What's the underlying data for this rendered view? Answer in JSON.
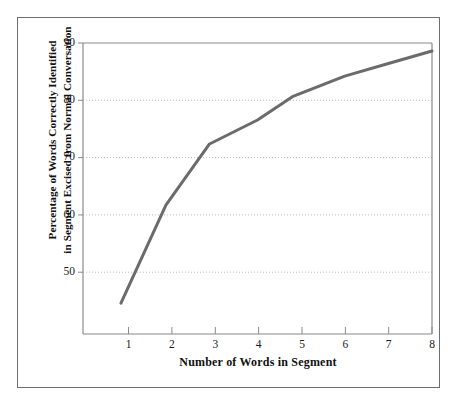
{
  "figure": {
    "background_color": "#ffffff",
    "frame_color": "#6e6e70",
    "axis_color": "#8a8a8c",
    "grid_color": "#bdbdbd",
    "line_color": "#6b6b6b",
    "text_color": "#111111"
  },
  "chart_data": {
    "type": "line",
    "title": "",
    "xlabel": "Number of Words in Segment",
    "ylabel": "Percentage of Words Correctly Identified in Segment Excised from Normal Conversation",
    "ylabel_line1": "Percentage of Words Correctly Identified",
    "ylabel_line2": "in Segment Excised from Normal Conversation",
    "xlim": [
      0.0,
      8.0
    ],
    "ylim": [
      39.0,
      90.0
    ],
    "xticks": [
      1,
      2,
      3,
      4,
      5,
      6,
      7,
      8
    ],
    "xtick_labels": [
      "1",
      "2",
      "3",
      "4",
      "5",
      "6",
      "7",
      "8"
    ],
    "yticks": [
      50,
      60,
      70,
      80,
      90
    ],
    "ytick_labels": [
      "50",
      "60",
      "70",
      "80",
      "90"
    ],
    "grid": "horizontal-dotted",
    "gridlines_y": [
      50,
      60,
      70,
      80
    ],
    "legend": "none",
    "series": [
      {
        "name": "Percentage correctly identified",
        "x": [
          0.87,
          1.9,
          2.9,
          4.0,
          4.8,
          6.0,
          7.0,
          8.0
        ],
        "values": [
          44.4,
          61.6,
          72.3,
          76.5,
          80.6,
          84.2,
          86.4,
          88.6
        ],
        "color": "#6b6b6b",
        "line_width": 3,
        "markers": "none"
      }
    ]
  }
}
